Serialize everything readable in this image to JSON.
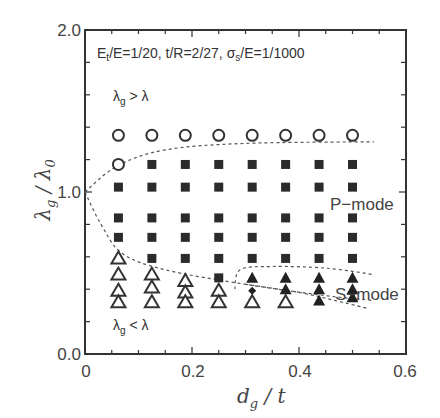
{
  "chart_data": {
    "type": "scatter",
    "title": "",
    "annotation": "Et/E=1/20, t/R=2/27, σs/E=1/1000",
    "annotation_parts": {
      "et": "E",
      "et_sub": "t",
      "rest1": "/E=1/20, t/R=2/27, ",
      "sigma": "σ",
      "sigma_sub": "s",
      "rest2": "/E=1/1000"
    },
    "xlabel": "d_g / t",
    "ylabel": "λ_g / λ_0",
    "xlim": [
      0,
      0.6
    ],
    "ylim": [
      0,
      2.0
    ],
    "x_ticks": [
      "0",
      "0.2",
      "0.4",
      "0.6"
    ],
    "y_ticks": [
      "0.0",
      "1.0",
      "2.0"
    ],
    "grid": false,
    "region_labels": [
      {
        "text": "λg > λ",
        "x": 0.07,
        "y": 1.6
      },
      {
        "text": "λg < λ",
        "x": 0.07,
        "y": 0.17
      },
      {
        "text": "P−mode",
        "x": 0.45,
        "y": 0.87
      },
      {
        "text": "S−mode",
        "x": 0.455,
        "y": 0.37
      }
    ],
    "series": [
      {
        "name": "λg > λ (open circles)",
        "marker": "open-circle",
        "points": [
          [
            0.0625,
            1.35
          ],
          [
            0.125,
            1.35
          ],
          [
            0.1875,
            1.35
          ],
          [
            0.25,
            1.35
          ],
          [
            0.3125,
            1.35
          ],
          [
            0.375,
            1.35
          ],
          [
            0.4375,
            1.35
          ],
          [
            0.5,
            1.35
          ],
          [
            0.0625,
            1.17
          ]
        ]
      },
      {
        "name": "P-mode (filled squares)",
        "marker": "filled-square",
        "points": [
          [
            0.125,
            1.17
          ],
          [
            0.1875,
            1.17
          ],
          [
            0.25,
            1.17
          ],
          [
            0.3125,
            1.17
          ],
          [
            0.375,
            1.17
          ],
          [
            0.4375,
            1.17
          ],
          [
            0.5,
            1.17
          ],
          [
            0.0625,
            1.03
          ],
          [
            0.125,
            1.03
          ],
          [
            0.1875,
            1.03
          ],
          [
            0.25,
            1.03
          ],
          [
            0.3125,
            1.03
          ],
          [
            0.375,
            1.03
          ],
          [
            0.4375,
            1.03
          ],
          [
            0.5,
            1.03
          ],
          [
            0.0625,
            0.84
          ],
          [
            0.125,
            0.84
          ],
          [
            0.1875,
            0.84
          ],
          [
            0.25,
            0.84
          ],
          [
            0.3125,
            0.84
          ],
          [
            0.375,
            0.84
          ],
          [
            0.4375,
            0.84
          ],
          [
            0.5,
            0.84
          ],
          [
            0.0625,
            0.72
          ],
          [
            0.125,
            0.72
          ],
          [
            0.1875,
            0.72
          ],
          [
            0.25,
            0.72
          ],
          [
            0.3125,
            0.72
          ],
          [
            0.375,
            0.72
          ],
          [
            0.4375,
            0.72
          ],
          [
            0.5,
            0.72
          ],
          [
            0.125,
            0.59
          ],
          [
            0.1875,
            0.59
          ],
          [
            0.25,
            0.59
          ],
          [
            0.3125,
            0.59
          ],
          [
            0.375,
            0.59
          ],
          [
            0.4375,
            0.59
          ],
          [
            0.5,
            0.59
          ],
          [
            0.25,
            0.47
          ]
        ]
      },
      {
        "name": "λg < λ (open triangles)",
        "marker": "open-triangle",
        "points": [
          [
            0.0625,
            0.59
          ],
          [
            0.0625,
            0.49
          ],
          [
            0.0625,
            0.39
          ],
          [
            0.0625,
            0.32
          ],
          [
            0.125,
            0.49
          ],
          [
            0.125,
            0.41
          ],
          [
            0.125,
            0.32
          ],
          [
            0.1875,
            0.45
          ],
          [
            0.1875,
            0.38
          ],
          [
            0.1875,
            0.32
          ],
          [
            0.25,
            0.39
          ],
          [
            0.25,
            0.32
          ],
          [
            0.3125,
            0.32
          ],
          [
            0.375,
            0.32
          ]
        ]
      },
      {
        "name": "S-mode (filled triangles)",
        "marker": "filled-triangle",
        "points": [
          [
            0.3125,
            0.47
          ],
          [
            0.375,
            0.47
          ],
          [
            0.375,
            0.4
          ],
          [
            0.4375,
            0.47
          ],
          [
            0.4375,
            0.4
          ],
          [
            0.4375,
            0.33
          ],
          [
            0.5,
            0.47
          ],
          [
            0.5,
            0.4
          ],
          [
            0.5,
            0.35
          ]
        ]
      },
      {
        "name": "transition (small diamond)",
        "marker": "filled-diamond",
        "points": [
          [
            0.3125,
            0.39
          ]
        ]
      }
    ],
    "boundary_curves": [
      {
        "name": "upper λg=λ boundary",
        "style": "dashed",
        "points": [
          [
            0,
            1.0
          ],
          [
            0.06,
            1.16
          ],
          [
            0.15,
            1.26
          ],
          [
            0.3,
            1.3
          ],
          [
            0.54,
            1.31
          ]
        ]
      },
      {
        "name": "lower λg=λ boundary",
        "style": "dashed",
        "points": [
          [
            0,
            1.0
          ],
          [
            0.03,
            0.8
          ],
          [
            0.07,
            0.62
          ],
          [
            0.15,
            0.52
          ],
          [
            0.3,
            0.43
          ],
          [
            0.45,
            0.36
          ],
          [
            0.54,
            0.33
          ]
        ]
      },
      {
        "name": "S-mode upper boundary",
        "style": "dashed",
        "points": [
          [
            0.28,
            0.4
          ],
          [
            0.29,
            0.52
          ],
          [
            0.35,
            0.54
          ],
          [
            0.45,
            0.53
          ],
          [
            0.54,
            0.49
          ]
        ]
      },
      {
        "name": "S-mode lower boundary",
        "style": "dashed",
        "points": [
          [
            0.3,
            0.43
          ],
          [
            0.4,
            0.38
          ],
          [
            0.48,
            0.32
          ],
          [
            0.53,
            0.28
          ]
        ]
      }
    ]
  }
}
